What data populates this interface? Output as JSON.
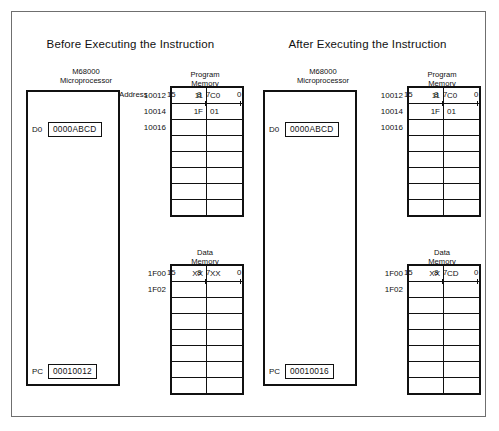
{
  "figure": {
    "panels": [
      {
        "title": "Before Executing the Instruction",
        "cpu": {
          "label_line1": "M68000",
          "label_line2": "Microprocessor",
          "registers": [
            {
              "name": "D0",
              "value": "0000ABCD"
            },
            {
              "name": "PC",
              "value": "00010012"
            }
          ]
        },
        "program_memory": {
          "title_line1": "Program",
          "title_line2": "Memory",
          "address_label": "Address",
          "bits": {
            "msb": "15",
            "mid_hi": "8",
            "mid_lo": "7",
            "lsb": "0"
          },
          "rows": [
            {
              "address": "10012",
              "hi": "11",
              "lo": "C0"
            },
            {
              "address": "10014",
              "hi": "1F",
              "lo": "01"
            },
            {
              "address": "10016",
              "hi": "",
              "lo": ""
            },
            {
              "address": "",
              "hi": "",
              "lo": ""
            },
            {
              "address": "",
              "hi": "",
              "lo": ""
            },
            {
              "address": "",
              "hi": "",
              "lo": ""
            },
            {
              "address": "",
              "hi": "",
              "lo": ""
            },
            {
              "address": "",
              "hi": "",
              "lo": ""
            }
          ]
        },
        "data_memory": {
          "title_line1": "Data",
          "title_line2": "Memory",
          "address_label": "",
          "bits": {
            "msb": "15",
            "mid_hi": "8",
            "mid_lo": "7",
            "lsb": "0"
          },
          "rows": [
            {
              "address": "1F00",
              "hi": "XX",
              "lo": "XX"
            },
            {
              "address": "1F02",
              "hi": "",
              "lo": ""
            },
            {
              "address": "",
              "hi": "",
              "lo": ""
            },
            {
              "address": "",
              "hi": "",
              "lo": ""
            },
            {
              "address": "",
              "hi": "",
              "lo": ""
            },
            {
              "address": "",
              "hi": "",
              "lo": ""
            },
            {
              "address": "",
              "hi": "",
              "lo": ""
            },
            {
              "address": "",
              "hi": "",
              "lo": ""
            }
          ]
        }
      },
      {
        "title": "After Executing the Instruction",
        "cpu": {
          "label_line1": "M68000",
          "label_line2": "Microprocessor",
          "registers": [
            {
              "name": "D0",
              "value": "0000ABCD"
            },
            {
              "name": "PC",
              "value": "00010016"
            }
          ]
        },
        "program_memory": {
          "title_line1": "Program",
          "title_line2": "Memory",
          "address_label": "",
          "bits": {
            "msb": "15",
            "mid_hi": "8",
            "mid_lo": "7",
            "lsb": "0"
          },
          "rows": [
            {
              "address": "10012",
              "hi": "11",
              "lo": "C0"
            },
            {
              "address": "10014",
              "hi": "1F",
              "lo": "01"
            },
            {
              "address": "10016",
              "hi": "",
              "lo": ""
            },
            {
              "address": "",
              "hi": "",
              "lo": ""
            },
            {
              "address": "",
              "hi": "",
              "lo": ""
            },
            {
              "address": "",
              "hi": "",
              "lo": ""
            },
            {
              "address": "",
              "hi": "",
              "lo": ""
            },
            {
              "address": "",
              "hi": "",
              "lo": ""
            }
          ]
        },
        "data_memory": {
          "title_line1": "Data",
          "title_line2": "Memory",
          "address_label": "",
          "bits": {
            "msb": "15",
            "mid_hi": "8",
            "mid_lo": "7",
            "lsb": "0"
          },
          "rows": [
            {
              "address": "1F00",
              "hi": "XX",
              "lo": "CD"
            },
            {
              "address": "1F02",
              "hi": "",
              "lo": ""
            },
            {
              "address": "",
              "hi": "",
              "lo": ""
            },
            {
              "address": "",
              "hi": "",
              "lo": ""
            },
            {
              "address": "",
              "hi": "",
              "lo": ""
            },
            {
              "address": "",
              "hi": "",
              "lo": ""
            },
            {
              "address": "",
              "hi": "",
              "lo": ""
            },
            {
              "address": "",
              "hi": "",
              "lo": ""
            }
          ]
        }
      }
    ]
  }
}
